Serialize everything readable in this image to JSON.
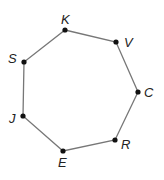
{
  "diagram": {
    "type": "heptagon",
    "edge_color": "#777777",
    "vertex_color": "#111111",
    "vertices": [
      {
        "label": "K",
        "x": 65,
        "y": 30,
        "lx": 61,
        "ly": 24
      },
      {
        "label": "V",
        "x": 116,
        "y": 42,
        "lx": 124,
        "ly": 47
      },
      {
        "label": "C",
        "x": 138,
        "y": 92,
        "lx": 144,
        "ly": 97
      },
      {
        "label": "R",
        "x": 115,
        "y": 140,
        "lx": 121,
        "ly": 149
      },
      {
        "label": "E",
        "x": 63,
        "y": 151,
        "lx": 58,
        "ly": 167
      },
      {
        "label": "J",
        "x": 23,
        "y": 116,
        "lx": 9,
        "ly": 123
      },
      {
        "label": "S",
        "x": 24,
        "y": 62,
        "lx": 8,
        "ly": 63
      }
    ]
  }
}
